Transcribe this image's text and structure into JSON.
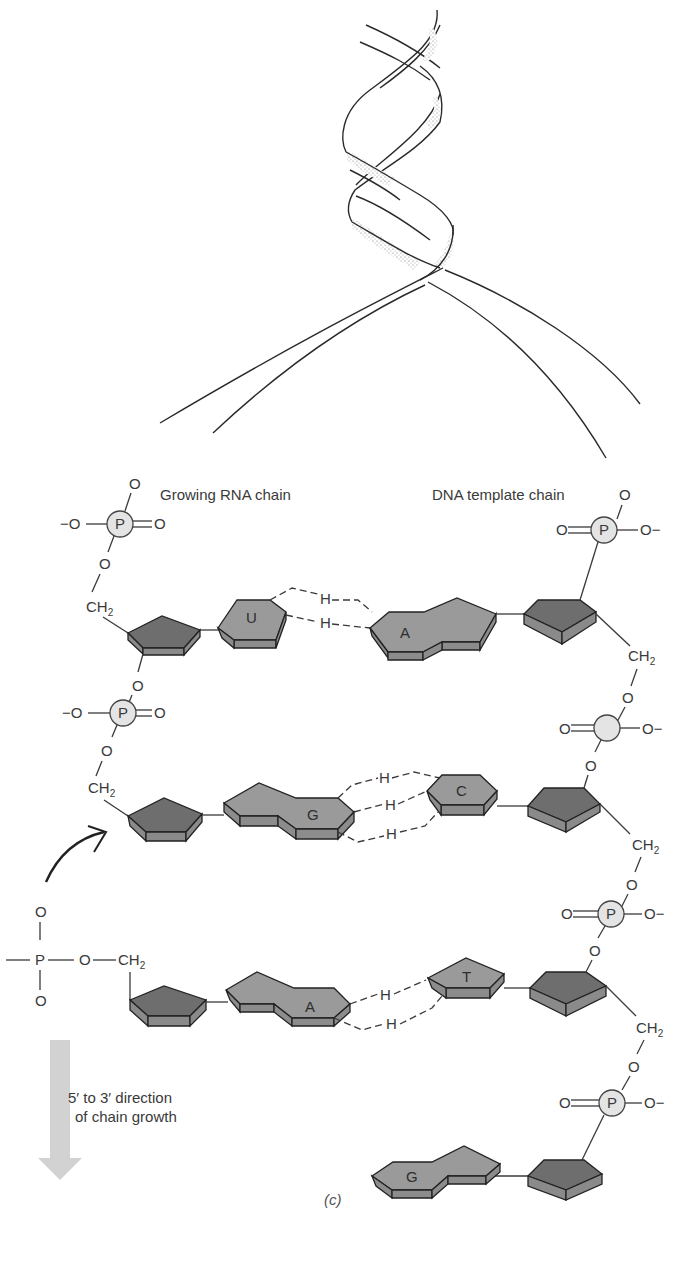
{
  "figure": {
    "panel_label": "(c)",
    "helix": {
      "description": "DNA double helix unwinding into two strands"
    },
    "labels": {
      "growing_rna_chain": "Growing RNA chain",
      "dna_template_chain": "DNA template chain",
      "direction_line1": "5′ to 3′ direction",
      "direction_line2": "of chain growth"
    },
    "rna_bases": [
      "U",
      "G",
      "A"
    ],
    "dna_bases": [
      "A",
      "C",
      "T",
      "G"
    ],
    "base_pairs": [
      {
        "rna": "U",
        "dna": "A",
        "h_bonds": 2
      },
      {
        "rna": "G",
        "dna": "C",
        "h_bonds": 3
      },
      {
        "rna": "A",
        "dna": "T",
        "h_bonds": 2
      },
      {
        "rna": null,
        "dna": "G",
        "h_bonds": 0
      }
    ],
    "atoms": {
      "P": "P",
      "O": "O",
      "O_minus": "−O",
      "O_minus_r": "O−",
      "CH": "CH",
      "sub2": "2",
      "H": "H"
    },
    "colors": {
      "sugar": "#6e6e6e",
      "base": "#9a9a9a",
      "phosphate": "#e4e4e4",
      "arrow": "#d2d2d2"
    }
  }
}
